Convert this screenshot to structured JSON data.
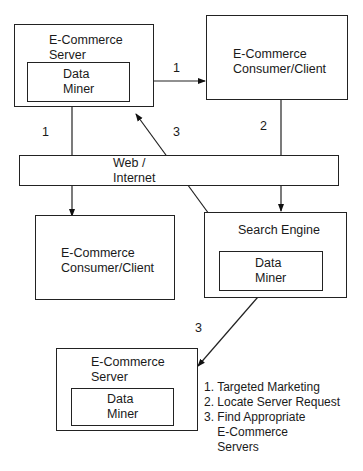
{
  "nodes": {
    "server_top": {
      "title": "E-Commerce\nServer",
      "inner": "Data\nMiner"
    },
    "client_top": {
      "title": "E-Commerce\nConsumer/Client"
    },
    "web": {
      "title": "Web /\nInternet"
    },
    "client_bottom": {
      "title": "E-Commerce\nConsumer/Client"
    },
    "search_engine": {
      "title": "Search Engine",
      "inner": "Data\nMiner"
    },
    "server_bottom": {
      "title": "E-Commerce\nServer",
      "inner": "Data\nMiner"
    }
  },
  "edge_labels": {
    "server_to_client": "1",
    "server_to_client_bottom": "1",
    "client_to_search": "2",
    "search_to_server": "3",
    "search_to_server_bottom": "3"
  },
  "legend": {
    "items": [
      "1. Targeted Marketing",
      "2. Locate Server Request",
      "3. Find Appropriate\n    E-Commerce\n    Servers"
    ]
  }
}
